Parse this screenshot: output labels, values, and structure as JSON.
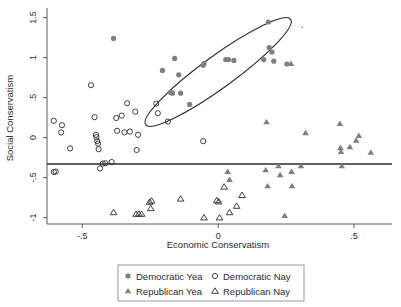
{
  "chart_data": {
    "type": "scatter",
    "title": "",
    "xlabel": "Economic Conservatism",
    "ylabel": "Social Conservatism",
    "xlim": [
      -0.63,
      0.64
    ],
    "ylim": [
      -1.08,
      1.62
    ],
    "xticks": [
      -0.5,
      0,
      0.5
    ],
    "xtick_labels": [
      "-.5",
      "0",
      ".5"
    ],
    "yticks": [
      -1,
      -0.5,
      0,
      0.5,
      1,
      1.5
    ],
    "ytick_labels": [
      "-1",
      "-.5",
      "0",
      ".5",
      "1",
      "1.5"
    ],
    "grid": false,
    "legend_position": "bottom",
    "annotations": [
      {
        "kind": "hline",
        "name": "cutpoint-line",
        "y": -0.33,
        "label": ""
      },
      {
        "kind": "ellipse",
        "name": "highlight-ellipse",
        "center_x": 0.0,
        "center_y": 0.82,
        "radius_x": 0.33,
        "radius_y": 0.2,
        "rotation_deg": -36,
        "label": ""
      }
    ],
    "series": [
      {
        "name": "Democratic Yea",
        "marker": "filled-circle",
        "color": "#7f7f7f",
        "points": [
          [
            -0.385,
            1.24
          ],
          [
            -0.205,
            0.84
          ],
          [
            -0.145,
            0.785
          ],
          [
            -0.16,
            0.99
          ],
          [
            -0.175,
            0.565
          ],
          [
            -0.168,
            0.555
          ],
          [
            -0.138,
            0.555
          ],
          [
            -0.105,
            0.415
          ],
          [
            -0.055,
            0.905
          ],
          [
            -0.052,
            0.925
          ],
          [
            0.028,
            0.975
          ],
          [
            0.038,
            0.975
          ],
          [
            0.058,
            0.965
          ],
          [
            0.185,
            1.445
          ],
          [
            0.188,
            1.125
          ],
          [
            0.198,
            1.07
          ],
          [
            0.168,
            0.975
          ],
          [
            0.205,
            0.955
          ],
          [
            0.253,
            0.92
          ]
        ]
      },
      {
        "name": "Democratic Nay",
        "marker": "open-circle",
        "color": "#2b2b2b",
        "points": [
          [
            -0.605,
            0.21
          ],
          [
            -0.575,
            0.155
          ],
          [
            -0.578,
            0.065
          ],
          [
            -0.545,
            -0.135
          ],
          [
            -0.468,
            0.655
          ],
          [
            -0.455,
            0.255
          ],
          [
            -0.45,
            0.035
          ],
          [
            -0.448,
            0.005
          ],
          [
            -0.445,
            -0.045
          ],
          [
            -0.442,
            -0.075
          ],
          [
            -0.44,
            -0.145
          ],
          [
            -0.435,
            -0.385
          ],
          [
            -0.425,
            -0.325
          ],
          [
            -0.415,
            -0.32
          ],
          [
            -0.392,
            -0.305
          ],
          [
            -0.375,
            0.245
          ],
          [
            -0.372,
            0.085
          ],
          [
            -0.355,
            0.275
          ],
          [
            -0.345,
            0.065
          ],
          [
            -0.335,
            0.43
          ],
          [
            -0.325,
            0.075
          ],
          [
            -0.305,
            0.325
          ],
          [
            -0.3,
            -0.155
          ],
          [
            -0.295,
            0.035
          ],
          [
            -0.605,
            -0.43
          ],
          [
            -0.598,
            -0.425
          ],
          [
            -0.228,
            0.425
          ],
          [
            -0.222,
            0.305
          ],
          [
            -0.185,
            0.2
          ],
          [
            -0.055,
            -0.045
          ]
        ]
      },
      {
        "name": "Republican Yea",
        "marker": "filled-triangle",
        "color": "#7f7f7f",
        "points": [
          [
            0.035,
            -0.425
          ],
          [
            0.042,
            -0.525
          ],
          [
            0.178,
            0.195
          ],
          [
            0.175,
            -0.405
          ],
          [
            0.182,
            -0.605
          ],
          [
            0.222,
            -0.355
          ],
          [
            0.228,
            -0.465
          ],
          [
            0.245,
            -0.975
          ],
          [
            0.27,
            -0.425
          ],
          [
            0.272,
            -0.605
          ],
          [
            0.305,
            -0.355
          ],
          [
            0.322,
            0.06
          ],
          [
            0.448,
            0.175
          ],
          [
            0.45,
            -0.125
          ],
          [
            0.452,
            -0.175
          ],
          [
            0.455,
            -0.355
          ],
          [
            0.485,
            -0.115
          ],
          [
            0.508,
            -0.035
          ],
          [
            0.518,
            0.025
          ],
          [
            0.562,
            -0.185
          ],
          [
            0.268,
            0.925
          ]
        ]
      },
      {
        "name": "Republican Nay",
        "marker": "open-triangle",
        "color": "#2b2b2b",
        "points": [
          [
            -0.385,
            -0.935
          ],
          [
            -0.302,
            -0.955
          ],
          [
            -0.292,
            -0.952
          ],
          [
            -0.282,
            -0.955
          ],
          [
            -0.245,
            -0.79
          ],
          [
            -0.248,
            -0.885
          ],
          [
            -0.252,
            -0.805
          ],
          [
            -0.138,
            -0.765
          ],
          [
            -0.052,
            -1.0
          ],
          [
            -0.005,
            -0.785
          ],
          [
            0.002,
            -0.8
          ],
          [
            0.005,
            -1.0
          ],
          [
            0.022,
            -0.615
          ],
          [
            0.042,
            -0.935
          ],
          [
            0.068,
            -0.855
          ],
          [
            0.088,
            -0.72
          ]
        ]
      }
    ]
  },
  "legend": {
    "items": [
      {
        "label": "Democratic Yea",
        "marker": "filled-circle"
      },
      {
        "label": "Democratic Nay",
        "marker": "open-circle"
      },
      {
        "label": "Republican Yea",
        "marker": "filled-triangle"
      },
      {
        "label": "Republican Nay",
        "marker": "open-triangle"
      }
    ]
  },
  "colors": {
    "marker_fill": "#7f7f7f",
    "marker_stroke": "#2b2b2b",
    "axis": "#5a5a5a",
    "annotation": "#2b2b2b",
    "background": "#ffffff"
  }
}
